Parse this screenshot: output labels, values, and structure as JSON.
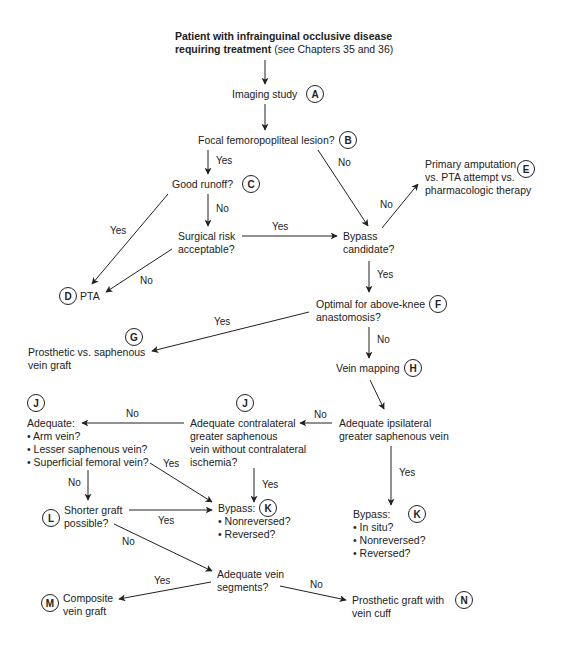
{
  "diagram": {
    "start": {
      "line1": "Patient with infrainguinal occlusive disease",
      "line2_bold": "requiring treatment",
      "line2_rest": " (see Chapters 35 and 36)"
    },
    "nodes": {
      "A": {
        "badge": "A",
        "lines": [
          "Imaging study"
        ]
      },
      "B": {
        "badge": "B",
        "lines": [
          "Focal femoropopliteal lesion?"
        ]
      },
      "C": {
        "badge": "C",
        "lines": [
          "Good runoff?"
        ]
      },
      "surgical_risk": {
        "lines": [
          "Surgical risk",
          "acceptable?"
        ]
      },
      "D": {
        "badge": "D",
        "lines": [
          "PTA"
        ]
      },
      "bypass_candidate": {
        "lines": [
          "Bypass",
          "candidate?"
        ]
      },
      "E": {
        "badge": "E",
        "lines": [
          "Primary amputation",
          "vs. PTA attempt vs.",
          "pharmacologic therapy"
        ]
      },
      "F": {
        "badge": "F",
        "lines": [
          "Optimal for above-knee",
          "anastomosis?"
        ]
      },
      "G": {
        "badge": "G",
        "lines": [
          "Prosthetic vs. saphenous",
          "vein graft"
        ]
      },
      "H": {
        "badge": "H",
        "lines": [
          "Vein mapping"
        ]
      },
      "ipsilateral": {
        "lines": [
          "Adequate ipsilateral",
          "greater saphenous vein"
        ]
      },
      "J_contra": {
        "badge": "J",
        "lines": [
          "Adequate contralateral",
          "greater saphenous",
          "vein without contralateral",
          "ischemia?"
        ]
      },
      "J_alt": {
        "badge": "J",
        "lines": [
          "Adequate:",
          "• Arm vein?",
          "• Lesser saphenous vein?",
          "• Superficial femoral vein?"
        ]
      },
      "K_left": {
        "badge": "K",
        "lines": [
          "Bypass:",
          "• Nonreversed?",
          "• Reversed?"
        ]
      },
      "K_right": {
        "badge": "K",
        "lines": [
          "Bypass:",
          "• In situ?",
          "• Nonreversed?",
          "• Reversed?"
        ]
      },
      "L": {
        "badge": "L",
        "lines": [
          "Shorter graft",
          "possible?"
        ]
      },
      "segments": {
        "lines": [
          "Adequate vein",
          "segments?"
        ]
      },
      "M": {
        "badge": "M",
        "lines": [
          "Composite",
          "vein graft"
        ]
      },
      "N": {
        "badge": "N",
        "lines": [
          "Prosthetic graft with",
          "vein cuff"
        ]
      }
    },
    "edge_labels": {
      "B_yes": "Yes",
      "B_no": "No",
      "C_yes": "Yes",
      "C_no": "No",
      "risk_yes": "Yes",
      "risk_no": "No",
      "bypass_no": "No",
      "bypass_yes": "Yes",
      "F_yes": "Yes",
      "F_no": "No",
      "ipsi_no": "No",
      "ipsi_yes": "Yes",
      "contra_no": "No",
      "contra_yes": "Yes",
      "alt_yes": "Yes",
      "alt_no": "No",
      "L_yes": "Yes",
      "L_no": "No",
      "seg_yes": "Yes",
      "seg_no": "No"
    }
  }
}
